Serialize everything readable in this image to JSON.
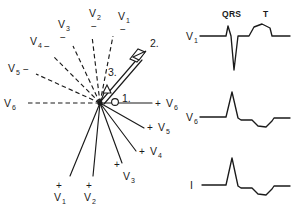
{
  "figure": {
    "ink_color": "#1a1a1a",
    "background_color": "#ffffff"
  },
  "vector_diagram": {
    "origin": {
      "x": 100,
      "y": 103
    },
    "negative_axes": [
      {
        "lead": "V",
        "sub": "1",
        "sign": "−",
        "label_x": 123,
        "label_y": 20,
        "sign_x": 124,
        "sign_y": 31,
        "x2": 113,
        "y2": 36
      },
      {
        "lead": "V",
        "sub": "2",
        "sign": "−",
        "label_x": 94,
        "label_y": 17,
        "sign_x": 95,
        "sign_y": 28,
        "x2": 92,
        "y2": 36
      },
      {
        "lead": "V",
        "sub": "3",
        "sign": "−",
        "label_x": 63,
        "label_y": 28,
        "sign_x": 64,
        "sign_y": 39,
        "x2": 73,
        "y2": 46
      },
      {
        "lead": "V",
        "sub": "4",
        "sign": "−",
        "label_x": 35,
        "label_y": 45,
        "sign_x": 50,
        "sign_y": 49,
        "x2": 54,
        "y2": 57
      },
      {
        "lead": "V",
        "sub": "5",
        "sign": "−",
        "label_x": 12,
        "label_y": 71,
        "sign_x": 28,
        "sign_y": 70,
        "x2": 36,
        "y2": 74
      },
      {
        "lead": "V",
        "sub": "6",
        "sign": "−",
        "label_x": 8,
        "label_y": 103,
        "sign_x": 0,
        "sign_y": 0,
        "x2": 26,
        "y2": 103
      }
    ],
    "positive_axes": [
      {
        "lead": "V",
        "sub": "6",
        "sign": "+",
        "label_x": 167,
        "label_y": 107,
        "sign_x": 157,
        "sign_y": 107,
        "x2": 152,
        "y2": 103
      },
      {
        "lead": "V",
        "sub": "5",
        "sign": "+",
        "label_x": 159,
        "label_y": 131,
        "sign_x": 149,
        "sign_y": 131,
        "x2": 144,
        "y2": 128
      },
      {
        "lead": "V",
        "sub": "4",
        "sign": "+",
        "label_x": 151,
        "label_y": 155,
        "sign_x": 141,
        "sign_y": 155,
        "x2": 136,
        "y2": 151
      },
      {
        "lead": "V",
        "sub": "3",
        "sign": "+",
        "label_x": 124,
        "label_y": 175,
        "sign_x": 117,
        "sign_y": 166,
        "x2": 122,
        "y2": 163
      },
      {
        "lead": "V",
        "sub": "2",
        "sign": "+",
        "label_x": 86,
        "label_y": 197,
        "sign_x": 88,
        "sign_y": 186,
        "x2": 93,
        "y2": 176
      },
      {
        "lead": "V",
        "sub": "1",
        "sign": "+",
        "label_x": 56,
        "label_y": 197,
        "sign_x": 58,
        "sign_y": 186,
        "x2": 70,
        "y2": 176
      }
    ],
    "mean_vectors": [
      {
        "number": "1.",
        "label_x": 123,
        "label_y": 102,
        "tip_x": 118,
        "tip_y": 103,
        "kind": "small-open-circle"
      },
      {
        "number": "2.",
        "label_x": 152,
        "label_y": 48,
        "tip_x": 146,
        "tip_y": 47,
        "kind": "long-double-line-arrow"
      },
      {
        "number": "3.",
        "label_x": 110,
        "label_y": 73,
        "tip_x": 107,
        "tip_y": 86,
        "kind": "short-arrow"
      }
    ]
  },
  "ecg_tracings": {
    "interval_labels": [
      {
        "text": "QRS",
        "x": 231,
        "y": 17
      },
      {
        "text": "T",
        "x": 265,
        "y": 17
      }
    ],
    "traces": [
      {
        "lead": "V",
        "sub": "1",
        "label_x": 190,
        "label_y": 40,
        "morphology": "rS with upright T",
        "baseline_y": 36
      },
      {
        "lead": "V",
        "sub": "6",
        "label_x": 190,
        "label_y": 117,
        "morphology": "tall R with inverted T",
        "baseline_y": 117
      },
      {
        "lead": "I",
        "sub": "",
        "label_x": 193,
        "label_y": 185,
        "morphology": "tall R with inverted T",
        "baseline_y": 185
      }
    ]
  }
}
